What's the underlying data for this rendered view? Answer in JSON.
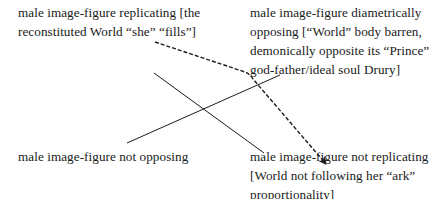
{
  "diagram": {
    "nodes": {
      "top_left": {
        "lines": [
          "male image-figure replicating [the",
          "reconstituted World “she” “fills”]"
        ]
      },
      "top_right": {
        "lines": [
          "male image-figure diametrically",
          "opposing [“World” body barren,",
          "demonically opposite its “Prince”",
          "god-father/ideal soul Drury]"
        ]
      },
      "bottom_left": {
        "lines": [
          "male image-figure not opposing"
        ]
      },
      "bottom_right": {
        "lines": [
          "male image-figure not replicating",
          "[World not following her “ark”",
          "proportionality]"
        ]
      }
    },
    "edges": [
      {
        "from": "top_left",
        "to": "bottom_right",
        "style": "dashed",
        "arrow": true
      },
      {
        "from": "top_left",
        "to": "bottom_right",
        "style": "solid",
        "arrow": false,
        "note": "diagonal"
      },
      {
        "from": "bottom_left",
        "to": "top_right",
        "style": "solid",
        "arrow": false,
        "note": "diagonal"
      }
    ],
    "colors": {
      "line": "#1a1a1a",
      "text": "#1a1a1a",
      "background": "#ffffff"
    }
  }
}
